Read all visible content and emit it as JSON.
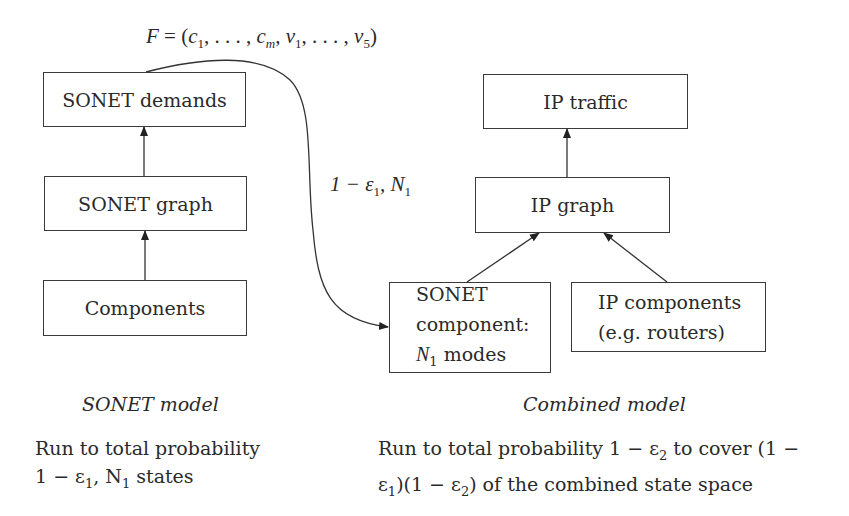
{
  "formula_label": {
    "F": "F",
    "eq": " = (",
    "c": "c",
    "c_sub1": "1",
    "sep1": ", . . . , ",
    "cm": "c",
    "cm_sub": "m",
    "sep2": ", ",
    "nu": "ν",
    "nu_sub1": "1",
    "sep3": ", . . . , ",
    "nu5": "ν",
    "nu_sub5": "5",
    "close": ")"
  },
  "edge_label": {
    "prefix": "1 − ε",
    "eps_sub": "1",
    "mid": ", N",
    "n_sub": "1"
  },
  "sonet_model": {
    "boxes": {
      "demands": "SONET demands",
      "graph": "SONET graph",
      "components": "Components"
    },
    "caption": "SONET model",
    "description": {
      "line1": "Run to total probability",
      "line2_prefix": "1 − ε",
      "line2_sub": "1",
      "line2_mid": ", N",
      "line2_nsub": "1",
      "line2_suffix": " states"
    }
  },
  "combined_model": {
    "boxes": {
      "ip_traffic": "IP traffic",
      "ip_graph": "IP graph",
      "sonet_component_line1": "SONET",
      "sonet_component_line2": "component:",
      "sonet_component_line3_n": "N",
      "sonet_component_line3_sub": "1",
      "sonet_component_line3_rest": " modes",
      "ip_components_line1": "IP components",
      "ip_components_line2": "(e.g. routers)"
    },
    "caption": "Combined model",
    "description": {
      "line1_prefix": "Run to total probability 1 − ε",
      "line1_sub": "2",
      "line1_suffix": " to cover (1 −",
      "line2_prefix": "ε",
      "line2_sub1": "1",
      "line2_mid": ")(1 − ε",
      "line2_sub2": "2",
      "line2_suffix": ") of the combined state space"
    }
  },
  "colors": {
    "stroke": "#3a3a3a",
    "text": "#2a2a2a",
    "background": "#ffffff"
  }
}
